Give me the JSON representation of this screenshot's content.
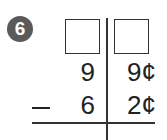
{
  "problem": {
    "number": "6",
    "answer_boxes": [
      "",
      ""
    ],
    "top_row": {
      "tens": "9",
      "ones": "9¢"
    },
    "bottom_row": {
      "operator": "minus",
      "tens": "6",
      "ones": "2¢"
    }
  }
}
